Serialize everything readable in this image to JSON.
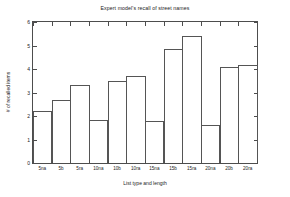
{
  "chart_data": {
    "type": "bar",
    "title": "Expert model's recall of street names",
    "xlabel": "List type and length",
    "ylabel": "# of recalled items",
    "categories": [
      "5na",
      "5b",
      "5ra",
      "10na",
      "10b",
      "10ra",
      "15na",
      "15b",
      "15ra",
      "20na",
      "20b",
      "20ra"
    ],
    "values": [
      2.23,
      2.7,
      3.31,
      1.82,
      3.47,
      3.72,
      1.8,
      4.87,
      5.42,
      1.63,
      4.08,
      4.16
    ],
    "ylim": [
      0,
      6
    ],
    "yticks": [
      0,
      1,
      2,
      3,
      4,
      5,
      6
    ],
    "ytick_labels": [
      "0",
      "1",
      "2",
      "3",
      "4",
      "5",
      "6"
    ],
    "grid": false,
    "legend": null,
    "bar_style": {
      "face_color": "#ffffff",
      "edge_color": "#555555"
    },
    "axis_color": "#4d4d4d"
  }
}
